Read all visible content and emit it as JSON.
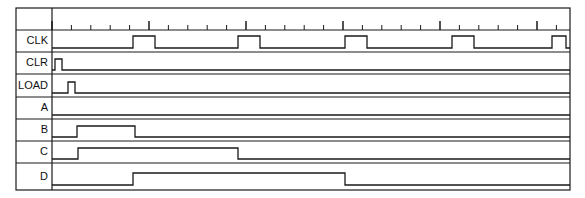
{
  "diagram": {
    "type": "digital-timing-waveform",
    "colors": {
      "background": "#ffffff",
      "line": "#1a1a1a",
      "frame": "#1a1a1a",
      "label_text": "#101010"
    },
    "frame": {
      "x": 16,
      "y": 8,
      "width": 554,
      "height": 182,
      "label_column_width": 36,
      "ruler_height": 22,
      "stroke_width": 1.2
    },
    "ruler": {
      "name": "time-ruler",
      "origin_x": 52,
      "end_x": 566,
      "tick_spacing": 19.4,
      "tick_count": 27,
      "minor_tick_length": 5,
      "major_tick_length": 9,
      "major_every": 5,
      "baseline_y": 30
    },
    "signals": [
      {
        "name": "CLK",
        "label": "CLK",
        "row_top": 30,
        "row_height": 22,
        "low_y": 48,
        "high_y": 36,
        "start_level": 0,
        "transitions": [
          133,
          155,
          238,
          260,
          345,
          367,
          452,
          474,
          552,
          566
        ],
        "description": "Clock with five high pulses"
      },
      {
        "name": "CLR",
        "label": "CLR",
        "row_top": 52,
        "row_height": 22,
        "low_y": 70,
        "high_y": 59,
        "start_level": 0,
        "transitions": [
          55,
          62
        ],
        "description": "Clear asserted briefly at start"
      },
      {
        "name": "LOAD",
        "label": "LOAD",
        "row_top": 74,
        "row_height": 23,
        "low_y": 93,
        "high_y": 82,
        "start_level": 0,
        "transitions": [
          68,
          75
        ],
        "description": "Load asserted briefly after clear"
      },
      {
        "name": "A",
        "label": "A",
        "row_top": 97,
        "row_height": 22,
        "low_y": 115,
        "high_y": 104,
        "start_level": 0,
        "transitions": [],
        "description": "Stays low for whole window"
      },
      {
        "name": "B",
        "label": "B",
        "row_top": 119,
        "row_height": 22,
        "low_y": 137,
        "high_y": 126,
        "start_level": 0,
        "transitions": [
          77,
          135
        ],
        "description": "High from ~77 to ~135"
      },
      {
        "name": "C",
        "label": "C",
        "row_top": 141,
        "row_height": 22,
        "low_y": 159,
        "high_y": 148,
        "start_level": 0,
        "transitions": [
          78,
          238
        ],
        "description": "High from ~78 to ~238"
      },
      {
        "name": "D",
        "label": "D",
        "row_top": 163,
        "row_height": 27,
        "low_y": 185,
        "high_y": 173,
        "start_level": 0,
        "transitions": [
          133,
          345
        ],
        "description": "High from ~133 to ~345"
      }
    ]
  }
}
